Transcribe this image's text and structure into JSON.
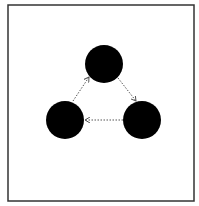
{
  "frame": {
    "x": 8,
    "y": 5,
    "width": 186,
    "height": 196,
    "stroke": "#333333"
  },
  "nodes": [
    {
      "id": "top",
      "cx": 104,
      "cy": 64,
      "r": 19,
      "fill": "#000000"
    },
    {
      "id": "left",
      "cx": 65,
      "cy": 120,
      "r": 19,
      "fill": "#000000"
    },
    {
      "id": "right",
      "cx": 142,
      "cy": 120,
      "r": 19,
      "fill": "#000000"
    }
  ],
  "edges": [
    {
      "from": "left",
      "to": "top",
      "x1": 73,
      "y1": 101,
      "x2": 89,
      "y2": 77,
      "style": "dotted",
      "arrow": "end",
      "color": "#555555"
    },
    {
      "from": "top",
      "to": "right",
      "x1": 118,
      "y1": 78,
      "x2": 136,
      "y2": 101,
      "style": "dotted",
      "arrow": "end",
      "color": "#555555"
    },
    {
      "from": "right",
      "to": "left",
      "x1": 123,
      "y1": 120,
      "x2": 85,
      "y2": 120,
      "style": "dotted",
      "arrow": "end",
      "color": "#555555"
    }
  ]
}
